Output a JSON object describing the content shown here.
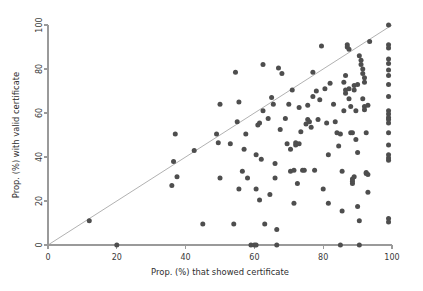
{
  "chart_data": {
    "type": "scatter",
    "title": "",
    "subtitle": "",
    "xlabel": "Prop. (%) that showed certificate",
    "ylabel": "Prop. (%) with valid certificate",
    "xlim": [
      0,
      100
    ],
    "ylim": [
      0,
      100
    ],
    "xticks": [
      0,
      20,
      40,
      60,
      80,
      100
    ],
    "yticks": [
      0,
      20,
      40,
      60,
      80,
      100
    ],
    "xticklabels": [
      "0",
      "20",
      "40",
      "60",
      "80",
      "100"
    ],
    "yticklabels": [
      "0",
      "20",
      "40",
      "60",
      "80",
      "100"
    ],
    "grid": false,
    "legend": null,
    "legend_position": "none",
    "marker_color": "#4e4e4e",
    "marker_size": 5,
    "annotations": [
      {
        "kind": "reference-line",
        "label": "y = x identity line",
        "from": [
          0,
          0
        ],
        "to": [
          100,
          100
        ],
        "color": "#a8a8a8"
      }
    ],
    "series": [
      {
        "name": "Clinics",
        "marker": "circle",
        "color": "#4e4e4e",
        "points": [
          [
            12,
            11
          ],
          [
            20,
            0
          ],
          [
            36,
            27
          ],
          [
            36.5,
            38
          ],
          [
            37,
            50.5
          ],
          [
            37.5,
            31
          ],
          [
            42.5,
            43
          ],
          [
            45,
            9.5
          ],
          [
            49,
            50.5
          ],
          [
            49.5,
            46.5
          ],
          [
            50,
            64
          ],
          [
            50,
            30.5
          ],
          [
            53,
            46
          ],
          [
            54,
            9.5
          ],
          [
            54.5,
            78.5
          ],
          [
            55,
            56
          ],
          [
            55.5,
            65
          ],
          [
            55.5,
            25.5
          ],
          [
            56.5,
            33.5
          ],
          [
            57,
            43.5
          ],
          [
            57.5,
            50.5
          ],
          [
            58,
            30.5
          ],
          [
            59,
            0
          ],
          [
            60,
            0
          ],
          [
            60.5,
            0
          ],
          [
            60.5,
            25.5
          ],
          [
            60.5,
            41
          ],
          [
            61,
            54.5
          ],
          [
            61.5,
            55.5
          ],
          [
            61.5,
            20.5
          ],
          [
            62,
            39
          ],
          [
            62.5,
            61
          ],
          [
            62.5,
            82
          ],
          [
            63,
            9.5
          ],
          [
            64,
            57.5
          ],
          [
            64.5,
            23
          ],
          [
            65,
            67
          ],
          [
            65.5,
            64
          ],
          [
            66,
            30.5
          ],
          [
            66,
            37
          ],
          [
            66.5,
            0
          ],
          [
            66.5,
            7
          ],
          [
            67,
            80.5
          ],
          [
            67.5,
            52.5
          ],
          [
            68,
            78
          ],
          [
            69,
            57.5
          ],
          [
            69.5,
            46
          ],
          [
            70,
            64
          ],
          [
            70.5,
            43.5
          ],
          [
            70.5,
            33.5
          ],
          [
            71,
            70.5
          ],
          [
            71.5,
            34
          ],
          [
            71.5,
            19
          ],
          [
            72,
            45.5
          ],
          [
            72,
            46.5
          ],
          [
            72.5,
            28
          ],
          [
            73,
            62.5
          ],
          [
            73,
            46
          ],
          [
            73.5,
            51.5
          ],
          [
            74,
            34
          ],
          [
            74.5,
            34
          ],
          [
            75,
            55
          ],
          [
            75.5,
            63.5
          ],
          [
            75.5,
            57
          ],
          [
            76,
            56
          ],
          [
            76.5,
            53.5
          ],
          [
            77,
            78.5
          ],
          [
            77,
            67.5
          ],
          [
            77.5,
            34
          ],
          [
            78,
            70
          ],
          [
            78.5,
            57
          ],
          [
            79,
            66
          ],
          [
            79.5,
            90.5
          ],
          [
            80,
            25.5
          ],
          [
            80.5,
            71
          ],
          [
            81,
            55.5
          ],
          [
            81.5,
            41
          ],
          [
            81.5,
            19
          ],
          [
            82,
            73.5
          ],
          [
            83,
            64
          ],
          [
            83.5,
            56
          ],
          [
            84,
            51
          ],
          [
            84.5,
            45
          ],
          [
            85,
            50.5
          ],
          [
            85,
            0
          ],
          [
            85.5,
            15.5
          ],
          [
            85.5,
            33.5
          ],
          [
            86,
            61
          ],
          [
            86,
            74
          ],
          [
            86.5,
            77
          ],
          [
            86.5,
            69
          ],
          [
            86.5,
            70.5
          ],
          [
            87,
            91
          ],
          [
            87,
            90
          ],
          [
            87.5,
            89
          ],
          [
            87.5,
            71
          ],
          [
            87.5,
            66.5
          ],
          [
            88,
            63
          ],
          [
            88,
            51
          ],
          [
            88.5,
            51
          ],
          [
            88.5,
            28
          ],
          [
            88.5,
            29
          ],
          [
            88.5,
            30
          ],
          [
            89,
            31
          ],
          [
            89,
            70.5
          ],
          [
            89,
            72.5
          ],
          [
            89.5,
            61
          ],
          [
            89.5,
            48
          ],
          [
            90,
            42
          ],
          [
            90,
            73
          ],
          [
            90,
            17.5
          ],
          [
            90.5,
            0
          ],
          [
            90.5,
            11
          ],
          [
            90.5,
            86
          ],
          [
            91,
            84
          ],
          [
            91,
            82
          ],
          [
            91.5,
            80
          ],
          [
            91.5,
            78
          ],
          [
            91.5,
            66.5
          ],
          [
            92,
            63
          ],
          [
            92,
            61.5
          ],
          [
            92,
            74
          ],
          [
            92,
            76
          ],
          [
            92.5,
            51
          ],
          [
            92.5,
            32.5
          ],
          [
            92.5,
            33
          ],
          [
            93,
            32
          ],
          [
            93,
            63.5
          ],
          [
            93,
            24
          ],
          [
            93.5,
            92.5
          ],
          [
            99,
            100
          ],
          [
            99,
            91
          ],
          [
            99,
            89.5
          ],
          [
            99,
            84.5
          ],
          [
            99,
            82.5
          ],
          [
            99,
            79.5
          ],
          [
            99,
            77
          ],
          [
            99,
            73
          ],
          [
            99,
            67.5
          ],
          [
            99,
            61
          ],
          [
            99,
            59.5
          ],
          [
            99,
            58
          ],
          [
            99,
            57
          ],
          [
            99,
            55.5
          ],
          [
            99,
            51
          ],
          [
            99,
            45.5
          ],
          [
            99,
            41
          ],
          [
            99,
            39.5
          ],
          [
            99,
            38.5
          ],
          [
            99,
            12
          ],
          [
            99,
            10.5
          ]
        ]
      }
    ]
  },
  "axes": {
    "x_title": "Prop. (%) that showed certificate",
    "y_title": "Prop. (%) with valid certificate"
  }
}
